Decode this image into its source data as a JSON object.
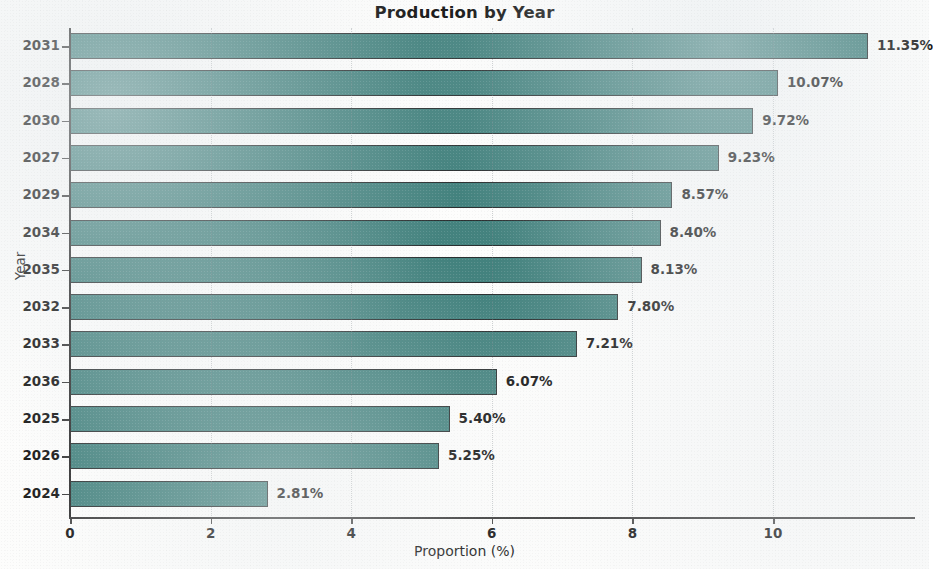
{
  "chart_data": {
    "type": "bar",
    "orientation": "horizontal",
    "title": "Production by Year",
    "xlabel": "Proportion (%)",
    "ylabel": "Year",
    "categories": [
      "2031",
      "2028",
      "2030",
      "2027",
      "2029",
      "2034",
      "2035",
      "2032",
      "2033",
      "2036",
      "2025",
      "2026",
      "2024"
    ],
    "values": [
      11.35,
      10.07,
      9.72,
      9.23,
      8.57,
      8.4,
      8.13,
      7.8,
      7.21,
      6.07,
      5.4,
      5.25,
      2.81
    ],
    "value_labels": [
      "11.35%",
      "10.07%",
      "9.72%",
      "9.23%",
      "8.57%",
      "8.40%",
      "8.13%",
      "7.80%",
      "7.21%",
      "6.07%",
      "5.40%",
      "5.25%",
      "2.81%"
    ],
    "xticks": [
      0,
      2,
      4,
      6,
      8,
      10
    ],
    "xtick_labels": [
      "0",
      "2",
      "4",
      "6",
      "8",
      "10"
    ],
    "xlim": [
      0,
      12
    ],
    "grid": "vertical-dotted",
    "legend": null,
    "bar_color": "#43827e",
    "bar_edge_color": "#2a2f30",
    "background_color": "#fdfdfc"
  }
}
